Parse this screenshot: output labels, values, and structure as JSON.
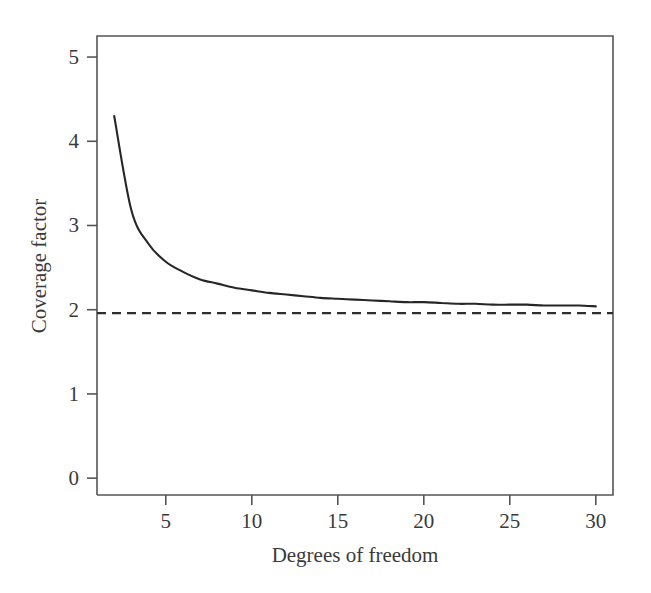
{
  "chart_data": {
    "type": "line",
    "title": "",
    "subtitle": "",
    "xlabel": "Degrees of freedom",
    "ylabel": "Coverage factor",
    "xlim": [
      1,
      31
    ],
    "ylim": [
      -0.2,
      5.25
    ],
    "grid": false,
    "legend": null,
    "xticks": [
      5,
      10,
      15,
      20,
      25,
      30
    ],
    "yticks": [
      0,
      1,
      2,
      3,
      4,
      5
    ],
    "xtick_labels": [
      "5",
      "10",
      "15",
      "20",
      "25",
      "30"
    ],
    "ytick_labels": [
      "0",
      "1",
      "2",
      "3",
      "4",
      "5"
    ],
    "series": [
      {
        "name": "Coverage factor t(95%, v)",
        "style": "solid",
        "color": "#262626",
        "x": [
          2,
          3,
          4,
          5,
          6,
          7,
          8,
          9,
          10,
          11,
          12,
          13,
          14,
          15,
          16,
          17,
          18,
          19,
          20,
          21,
          22,
          23,
          24,
          25,
          26,
          27,
          28,
          29,
          30
        ],
        "values": [
          4.3,
          3.18,
          2.78,
          2.57,
          2.45,
          2.36,
          2.31,
          2.26,
          2.23,
          2.2,
          2.18,
          2.16,
          2.14,
          2.13,
          2.12,
          2.11,
          2.1,
          2.09,
          2.09,
          2.08,
          2.07,
          2.07,
          2.06,
          2.06,
          2.06,
          2.05,
          2.05,
          2.05,
          2.04
        ]
      },
      {
        "name": "Asymptote (normal, 95%)",
        "style": "dashed",
        "color": "#2e2e2e",
        "constant_y": 1.96,
        "x": [
          1,
          31
        ],
        "values": [
          1.96,
          1.96
        ]
      }
    ],
    "annotations": []
  },
  "axes": {
    "x_title": "Degrees of freedom",
    "y_title": "Coverage factor"
  }
}
